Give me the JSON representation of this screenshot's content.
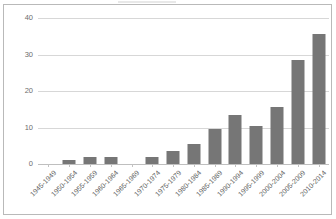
{
  "chart_data": {
    "type": "bar",
    "title": "",
    "subtitle": "",
    "xlabel": "",
    "ylabel": "",
    "categories": [
      "1945-1949",
      "1950-1954",
      "1955-1959",
      "1960-1964",
      "1965-1969",
      "1970-1974",
      "1975-1979",
      "1980-1984",
      "1985-1989",
      "1990-1994",
      "1995-1999",
      "2000-2004",
      "2005-2009",
      "2010-2014"
    ],
    "values": [
      0,
      1,
      2,
      2,
      0,
      2,
      3.5,
      5.5,
      9.5,
      13.5,
      10.5,
      15.5,
      28.5,
      35.5
    ],
    "ylim": [
      0,
      40
    ],
    "ytick_labels": [
      "0",
      "10",
      "20",
      "30",
      "40"
    ],
    "ytick_values": [
      0,
      10,
      20,
      30,
      40
    ],
    "grid": true,
    "legend": null,
    "legend_position": "none",
    "bar_color": "#767676",
    "gridline_color": "#d7d7d7",
    "axis_color": "#bfbfbf",
    "border_color": "#b9b9b9",
    "background_color": "#ffffff",
    "label_color": "#5e5e5e",
    "xlabel_rotation_deg": -45
  }
}
